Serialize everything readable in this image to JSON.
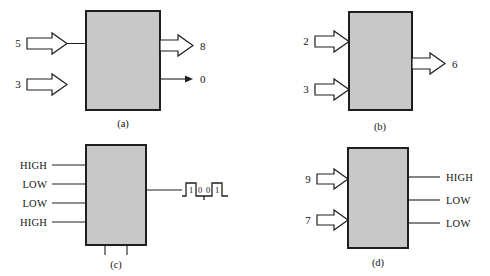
{
  "figure": {
    "background_color": "#ffffff",
    "block_fill_color": "#c8c8c8",
    "line_color": "#1f1f1f",
    "panels": [
      {
        "id": "a",
        "caption": "(a)",
        "inputs": [
          {
            "label": "5",
            "style": "block-arrow"
          },
          {
            "label": "3",
            "style": "block-arrow"
          }
        ],
        "outputs": [
          {
            "label": "8",
            "style": "block-arrow"
          },
          {
            "label": "0",
            "style": "thin-arrow"
          }
        ]
      },
      {
        "id": "b",
        "caption": "(b)",
        "inputs": [
          {
            "label": "2",
            "style": "block-arrow"
          },
          {
            "label": "3",
            "style": "block-arrow"
          }
        ],
        "outputs": [
          {
            "label": "6",
            "style": "block-arrow"
          }
        ]
      },
      {
        "id": "c",
        "caption": "(c)",
        "inputs": [
          {
            "label": "HIGH",
            "style": "line"
          },
          {
            "label": "LOW",
            "style": "line"
          },
          {
            "label": "LOW",
            "style": "line"
          },
          {
            "label": "HIGH",
            "style": "line"
          }
        ],
        "outputs": [
          {
            "label": "",
            "style": "waveform"
          }
        ],
        "bottom_stubs": 2,
        "waveform_bits": [
          "1",
          "0",
          "0",
          "1"
        ]
      },
      {
        "id": "d",
        "caption": "(d)",
        "inputs": [
          {
            "label": "9",
            "style": "block-arrow"
          },
          {
            "label": "7",
            "style": "block-arrow"
          }
        ],
        "outputs": [
          {
            "label": "HIGH",
            "style": "line"
          },
          {
            "label": "LOW",
            "style": "line"
          },
          {
            "label": "LOW",
            "style": "line"
          }
        ]
      }
    ]
  }
}
